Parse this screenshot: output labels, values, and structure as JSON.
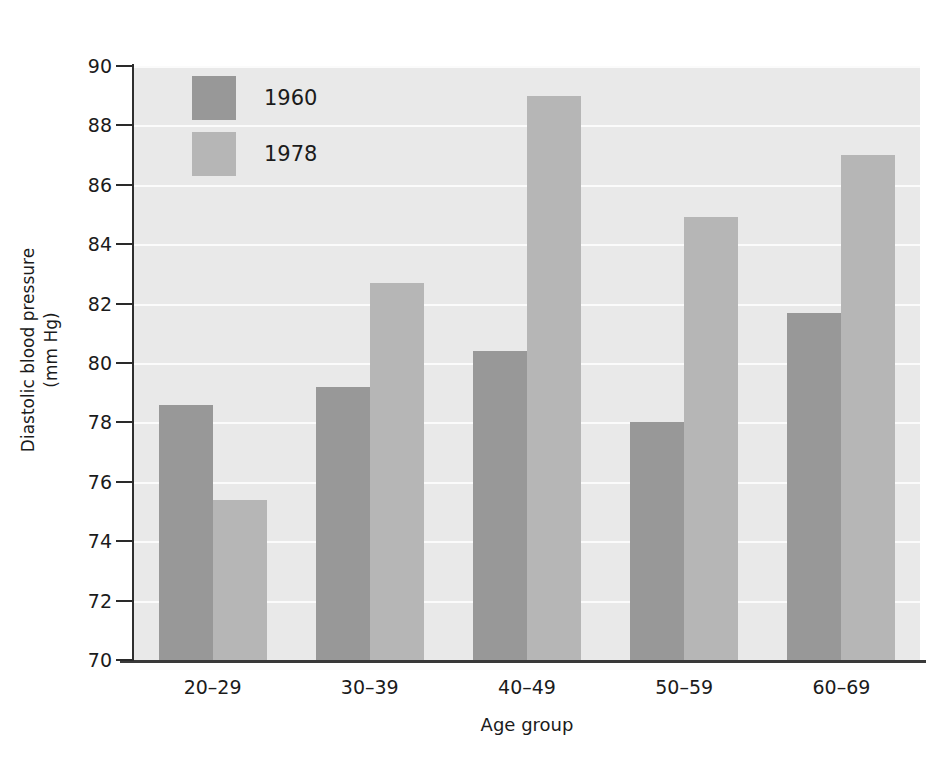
{
  "chart_data": {
    "type": "bar",
    "title": "",
    "xlabel": "Age group",
    "ylabel_line1": "Diastolic blood pressure",
    "ylabel_line2": "(mm Hg)",
    "categories": [
      "20–29",
      "30–39",
      "40–49",
      "50–59",
      "60–69"
    ],
    "series": [
      {
        "name": "1960",
        "color": "#989898",
        "values": [
          78.6,
          79.2,
          80.4,
          78.0,
          81.7
        ]
      },
      {
        "name": "1978",
        "color": "#b6b6b6",
        "values": [
          75.4,
          82.7,
          89.0,
          84.9,
          87.0
        ]
      }
    ],
    "ylim": [
      70,
      90
    ],
    "ytick_values": [
      70,
      72,
      74,
      76,
      78,
      80,
      82,
      84,
      86,
      88,
      90
    ],
    "ytick_labels": [
      "70",
      "72",
      "74",
      "76",
      "78",
      "80",
      "82",
      "84",
      "86",
      "88",
      "90"
    ],
    "grid": true,
    "gridline_color": "#fbfbfb",
    "plot_background": "#e9e9e9",
    "figure_background": "#ffffff",
    "legend_position": "upper-left-inside"
  },
  "legend": {
    "entries": [
      {
        "label": "1960",
        "color": "#989898"
      },
      {
        "label": "1978",
        "color": "#b6b6b6"
      }
    ]
  },
  "axes": {
    "y_title_line1": "Diastolic blood pressure",
    "y_title_line2": "(mm Hg)",
    "x_title": "Age group"
  }
}
